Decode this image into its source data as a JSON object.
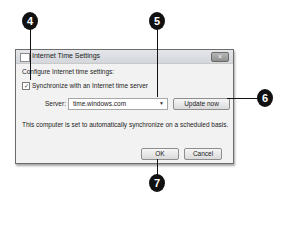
{
  "dialog": {
    "title": "Internet Time Settings",
    "close_label": "×",
    "heading": "Configure Internet time settings:",
    "sync_checkbox": {
      "label": "Synchronize with an Internet time server",
      "checked": true,
      "glyph": "✓"
    },
    "server_label": "Server:",
    "server_value": "time.windows.com",
    "dropdown_icon": "▼",
    "update_button": "Update now",
    "status_text": "This computer is set to automatically synchronize on a scheduled basis.",
    "ok_button": "OK",
    "cancel_button": "Cancel"
  },
  "callouts": [
    {
      "number": "4"
    },
    {
      "number": "5"
    },
    {
      "number": "6"
    },
    {
      "number": "7"
    }
  ]
}
